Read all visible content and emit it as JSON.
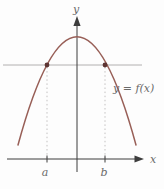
{
  "figure": {
    "y_axis_label": "y",
    "x_axis_label": "x",
    "curve_label": "y = f(x)",
    "point_a_label": "a",
    "point_b_label": "b"
  },
  "colors": {
    "background": "#fdfdfd",
    "curve": "#985f57",
    "point": "#5d3533",
    "axis": "#3d3d3d",
    "hline": "#b2b0b0",
    "dotted": "#c3c1c1",
    "label": "#6a6a6a"
  }
}
